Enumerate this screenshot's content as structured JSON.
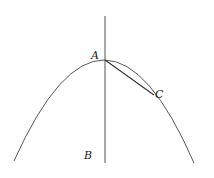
{
  "diagram": {
    "type": "parabola-with-axis-and-chord",
    "labels": {
      "A": "A",
      "B": "B",
      "C": "C"
    },
    "points": {
      "A": {
        "x": 105,
        "y": 60
      },
      "C": {
        "x": 154,
        "y": 95
      },
      "B_label_pos": {
        "x": 86,
        "y": 158
      }
    },
    "stroke_color": "#555555",
    "elements": [
      "parabola",
      "axis line AB",
      "chord AC"
    ]
  }
}
